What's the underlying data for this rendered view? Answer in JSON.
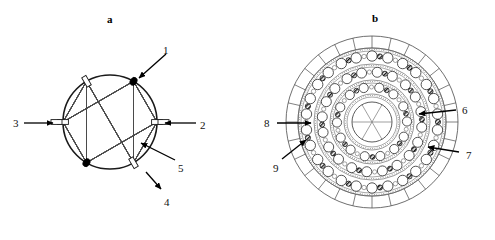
{
  "figure": {
    "width": 495,
    "height": 214,
    "background": "#ffffff",
    "ink_color": "#000000",
    "line_color": "#3a3a3a"
  },
  "panels": [
    {
      "id": "a",
      "label": "a",
      "label_x": 107,
      "label_y": 14,
      "title": "winding schematic",
      "center_x": 110,
      "center_y": 122,
      "radius": 47
    },
    {
      "id": "b",
      "label": "b",
      "label_x": 372,
      "label_y": 13,
      "title": "cross-section",
      "center_x": 372,
      "center_y": 122,
      "radius": 86
    }
  ],
  "panel_a": {
    "callouts": [
      {
        "id": "1",
        "text": "1",
        "label_x": 163,
        "label_y": 45,
        "arrow_from": [
          166,
          54
        ],
        "arrow_to": [
          139,
          78
        ]
      },
      {
        "id": "2",
        "text": "2",
        "label_x": 200,
        "label_y": 120,
        "arrow_from": [
          196,
          123
        ],
        "arrow_to": [
          165,
          123
        ]
      },
      {
        "id": "3",
        "text": "3",
        "label_x": 13,
        "label_y": 118,
        "arrow_from": [
          24,
          123
        ],
        "arrow_to": [
          53,
          123
        ]
      },
      {
        "id": "4",
        "text": "4",
        "label_x": 164,
        "label_y": 197,
        "arrow_from": [
          146,
          172
        ],
        "arrow_to": [
          161,
          189
        ]
      },
      {
        "id": "5",
        "text": "5",
        "label_x": 178,
        "label_y": 163,
        "arrow_from": [
          175,
          160
        ],
        "arrow_to": [
          141,
          143
        ]
      }
    ],
    "terminals": [
      {
        "angle_deg": -60,
        "style": "filled",
        "name": "terminal-upper-left"
      },
      {
        "angle_deg": -120,
        "style": "hollow",
        "name": "terminal-upper-right"
      },
      {
        "angle_deg": 0,
        "style": "hollow",
        "name": "terminal-right"
      },
      {
        "angle_deg": 180,
        "style": "hollow",
        "name": "terminal-left"
      },
      {
        "angle_deg": 60,
        "style": "hollow",
        "name": "terminal-lower-right"
      },
      {
        "angle_deg": 120,
        "style": "filled",
        "name": "terminal-lower-left"
      }
    ],
    "winding_strands_per_group": 11,
    "winding_description": "six-pole star-connected winding chords"
  },
  "panel_b": {
    "callouts": [
      {
        "id": "6",
        "text": "6",
        "label_x": 462,
        "label_y": 105,
        "arrow_from": [
          456,
          110
        ],
        "arrow_to": [
          419,
          114
        ]
      },
      {
        "id": "7",
        "text": "7",
        "label_x": 466,
        "label_y": 150,
        "arrow_from": [
          459,
          152
        ],
        "arrow_to": [
          428,
          147
        ]
      },
      {
        "id": "8",
        "text": "8",
        "label_x": 264,
        "label_y": 118,
        "arrow_from": [
          277,
          123
        ],
        "arrow_to": [
          311,
          123
        ]
      },
      {
        "id": "9",
        "text": "9",
        "label_x": 273,
        "label_y": 163,
        "arrow_from": [
          282,
          159
        ],
        "arrow_to": [
          306,
          140
        ]
      }
    ],
    "outer_segments": 28,
    "rings": [
      {
        "name": "ring-outer-conductors",
        "radius": 66,
        "count": 26,
        "big_r": 5.2,
        "small_r": 2.6
      },
      {
        "name": "ring-middle-conductors",
        "radius": 50,
        "count": 20,
        "big_r": 5.0,
        "small_r": 2.5
      },
      {
        "name": "ring-inner-conductors",
        "radius": 35,
        "count": 14,
        "big_r": 4.6,
        "small_r": 2.4
      }
    ],
    "core_radius": 20,
    "core_spokes": 3,
    "band_radii": [
      74,
      58,
      42,
      28
    ],
    "outer_ring_inner_radius": 74,
    "outer_ring_outer_radius": 86
  }
}
